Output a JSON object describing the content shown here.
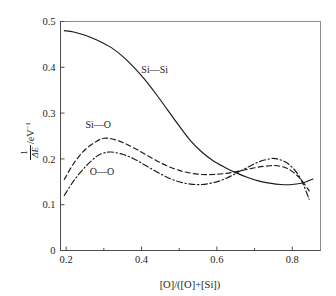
{
  "chart_data": {
    "type": "line",
    "title": "",
    "xlabel": "[O]/([O]+[Si])",
    "ylabel_numerator": "1",
    "ylabel_denominator": "ΔE",
    "ylabel_unit": "/eV",
    "ylabel_unit_exponent": "−1",
    "xlim": [
      0.185,
      0.875
    ],
    "ylim": [
      0.0,
      0.5
    ],
    "grid": false,
    "legend_position": "inline-annotations",
    "xticks": [
      0.2,
      0.4,
      0.6,
      0.8
    ],
    "xtick_labels": [
      "0.2",
      "0.4",
      "0.6",
      "0.8"
    ],
    "xminor_ticks": [
      0.3,
      0.5,
      0.7
    ],
    "yticks": [
      0.0,
      0.1,
      0.2,
      0.3,
      0.4,
      0.5
    ],
    "ytick_labels": [
      "0",
      "0.1",
      "0.2",
      "0.3",
      "0.4",
      "0.5"
    ],
    "series": [
      {
        "name": "Si—Si",
        "style": "solid",
        "label": "Si—Si",
        "label_x": 0.435,
        "label_y": 0.395,
        "x": [
          0.195,
          0.22,
          0.25,
          0.28,
          0.3,
          0.32,
          0.35,
          0.38,
          0.41,
          0.44,
          0.47,
          0.5,
          0.53,
          0.56,
          0.59,
          0.62,
          0.65,
          0.68,
          0.71,
          0.74,
          0.77,
          0.8,
          0.83,
          0.855
        ],
        "y": [
          0.48,
          0.477,
          0.47,
          0.46,
          0.452,
          0.443,
          0.424,
          0.4,
          0.372,
          0.34,
          0.306,
          0.272,
          0.24,
          0.215,
          0.196,
          0.182,
          0.17,
          0.16,
          0.152,
          0.147,
          0.144,
          0.144,
          0.148,
          0.156
        ]
      },
      {
        "name": "Si—O",
        "style": "dashed",
        "label": "Si—O",
        "label_x": 0.285,
        "label_y": 0.275,
        "x": [
          0.195,
          0.22,
          0.25,
          0.28,
          0.3,
          0.32,
          0.35,
          0.38,
          0.41,
          0.44,
          0.47,
          0.5,
          0.53,
          0.56,
          0.59,
          0.62,
          0.65,
          0.68,
          0.71,
          0.74,
          0.76,
          0.79,
          0.82,
          0.845
        ],
        "y": [
          0.155,
          0.19,
          0.22,
          0.238,
          0.245,
          0.244,
          0.236,
          0.224,
          0.21,
          0.196,
          0.184,
          0.175,
          0.169,
          0.166,
          0.166,
          0.168,
          0.172,
          0.177,
          0.182,
          0.185,
          0.185,
          0.178,
          0.158,
          0.13
        ]
      },
      {
        "name": "O—O",
        "style": "dashdot",
        "label": "O—O",
        "label_x": 0.295,
        "label_y": 0.172,
        "x": [
          0.195,
          0.22,
          0.25,
          0.28,
          0.3,
          0.32,
          0.35,
          0.38,
          0.41,
          0.44,
          0.47,
          0.5,
          0.53,
          0.56,
          0.59,
          0.62,
          0.65,
          0.68,
          0.71,
          0.74,
          0.76,
          0.79,
          0.82,
          0.845
        ],
        "y": [
          0.12,
          0.152,
          0.182,
          0.205,
          0.213,
          0.215,
          0.21,
          0.2,
          0.186,
          0.172,
          0.159,
          0.15,
          0.145,
          0.144,
          0.148,
          0.156,
          0.168,
          0.181,
          0.193,
          0.2,
          0.2,
          0.189,
          0.16,
          0.112
        ]
      }
    ]
  }
}
